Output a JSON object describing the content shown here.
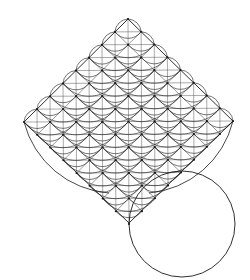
{
  "figure": {
    "width": 250,
    "height": 280,
    "background": "#ffffff",
    "stroke_color": "#1a1a1a",
    "grid_color": "#555555",
    "diamond": {
      "top": [
        128,
        19
      ],
      "right": [
        233,
        121
      ],
      "bottom": [
        129,
        223
      ],
      "left": [
        24,
        122
      ],
      "divisions": 8
    },
    "circle": {
      "cx": 182,
      "cy": 224,
      "r": 53
    }
  }
}
